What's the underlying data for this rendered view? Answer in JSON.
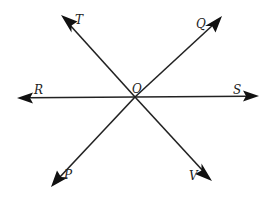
{
  "diagram": {
    "center_label": "O",
    "lines": [
      {
        "name": "line-RS",
        "ends": [
          "R",
          "S"
        ]
      },
      {
        "name": "line-TV",
        "ends": [
          "T",
          "V"
        ]
      },
      {
        "name": "line-PQ",
        "ends": [
          "P",
          "Q"
        ]
      }
    ],
    "labels": {
      "T": "T",
      "Q": "Q",
      "R": "R",
      "S": "S",
      "O": "O",
      "P": "P",
      "V": "V"
    },
    "colors": {
      "line": "#222222",
      "background": "#ffffff"
    }
  }
}
